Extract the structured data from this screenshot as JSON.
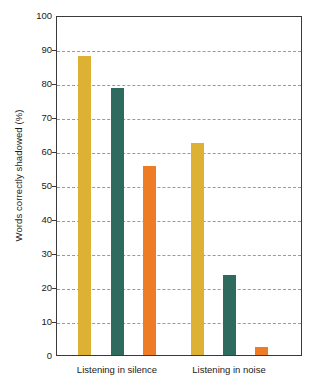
{
  "chart_data": {
    "type": "bar",
    "title": "",
    "xlabel": "",
    "ylabel": "Words correctly shadowed (%)",
    "ylim": [
      0,
      100
    ],
    "yticks": [
      0,
      10,
      20,
      30,
      40,
      50,
      60,
      70,
      80,
      90,
      100
    ],
    "ytick_labels": [
      "0",
      "10",
      "20",
      "30",
      "40",
      "50",
      "60",
      "70",
      "80",
      "90",
      "100"
    ],
    "grid": "horizontal-dashed",
    "legend": "none",
    "categories": [
      "Listening in silence",
      "Listening in noise"
    ],
    "series": [
      {
        "name": "series-1",
        "color": "#ddb234",
        "values": [
          88,
          62.5
        ]
      },
      {
        "name": "series-2",
        "color": "#2e6b5e",
        "values": [
          78.5,
          23.5
        ]
      },
      {
        "name": "series-3",
        "color": "#ee7b26",
        "values": [
          55.5,
          2.5
        ]
      }
    ],
    "bars": [
      {
        "group": "Listening in silence",
        "series": "series-1",
        "value": 88,
        "color": "#ddb234"
      },
      {
        "group": "Listening in silence",
        "series": "series-2",
        "value": 78.5,
        "color": "#2e6b5e"
      },
      {
        "group": "Listening in silence",
        "series": "series-3",
        "value": 55.5,
        "color": "#ee7b26"
      },
      {
        "group": "Listening in noise",
        "series": "series-1",
        "value": 62.5,
        "color": "#ddb234"
      },
      {
        "group": "Listening in noise",
        "series": "series-2",
        "value": 23.5,
        "color": "#2e6b5e"
      },
      {
        "group": "Listening in noise",
        "series": "series-3",
        "value": 2.5,
        "color": "#ee7b26"
      }
    ]
  },
  "axis": {
    "y_title": "Words correctly shadowed (%)",
    "y_tick_0": "0",
    "y_tick_10": "10",
    "y_tick_20": "20",
    "y_tick_30": "30",
    "y_tick_40": "40",
    "y_tick_50": "50",
    "y_tick_60": "60",
    "y_tick_70": "70",
    "y_tick_80": "80",
    "y_tick_90": "90",
    "y_tick_100": "100"
  },
  "groups": {
    "g0_label": "Listening in silence",
    "g1_label": "Listening in noise"
  },
  "colors": {
    "gold": "#ddb234",
    "teal": "#2e6b5e",
    "orange": "#ee7b26",
    "axis": "#3a3a3a",
    "grid": "#9a9a9a",
    "text": "#1a1a1a",
    "background": "#ffffff"
  }
}
